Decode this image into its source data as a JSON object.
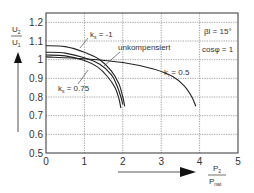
{
  "chart_data": {
    "type": "line",
    "title": "",
    "xlabel": {
      "numerator": "P",
      "numerator_sub": "2",
      "denominator": "P",
      "denominator_sub": "nat"
    },
    "ylabel": {
      "numerator": "U",
      "numerator_sub": "2",
      "denominator": "U",
      "denominator_sub": "1"
    },
    "xlim": [
      0,
      5
    ],
    "ylim": [
      0.5,
      1.25
    ],
    "x_ticks": [
      "0",
      "1",
      "2",
      "3",
      "4",
      "5"
    ],
    "y_ticks": [
      "0.5",
      "0.6",
      "0.7",
      "0.8",
      "0.9",
      "1",
      "1.1",
      "1.2"
    ],
    "grid": true,
    "annotations": {
      "beta": "βl = 15°",
      "cosphi": "cosφ = 1"
    },
    "series": [
      {
        "name": "k_s = -1",
        "label": "k",
        "label_sub": "s",
        "label_rest": " = -1",
        "x": [
          0,
          0.5,
          1.0,
          1.4,
          1.7,
          1.9,
          2.0,
          2.05
        ],
        "y": [
          1.075,
          1.07,
          1.04,
          1.0,
          0.94,
          0.87,
          0.8,
          0.75
        ]
      },
      {
        "name": "unkompensiert",
        "label": "unkompensiert",
        "x": [
          0,
          0.5,
          1.0,
          1.4,
          1.7,
          1.85,
          1.95,
          2.0
        ],
        "y": [
          1.04,
          1.035,
          1.01,
          0.975,
          0.92,
          0.86,
          0.8,
          0.76
        ]
      },
      {
        "name": "k_s = 0.75",
        "label": "k",
        "label_sub": "s",
        "label_rest": " = 0.75",
        "x": [
          0,
          0.5,
          1.0,
          1.35,
          1.6,
          1.8,
          1.9,
          1.95
        ],
        "y": [
          1.025,
          1.02,
          0.995,
          0.96,
          0.91,
          0.85,
          0.79,
          0.74
        ]
      },
      {
        "name": "k_i = 0.5",
        "label": "k",
        "label_sub": "i",
        "label_rest": " = 0.5",
        "x": [
          0,
          1.0,
          2.0,
          2.8,
          3.3,
          3.6,
          3.8,
          3.9
        ],
        "y": [
          1.015,
          1.005,
          0.985,
          0.95,
          0.91,
          0.86,
          0.8,
          0.75
        ]
      }
    ]
  }
}
